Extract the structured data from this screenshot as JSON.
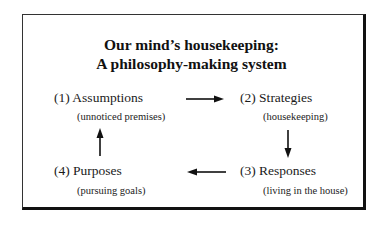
{
  "title": {
    "line1": "Our mind’s housekeeping:",
    "line2": "A  philosophy-making system"
  },
  "nodes": [
    {
      "label": "(1) Assumptions",
      "sub": "(unnoticed premises)"
    },
    {
      "label": "(2) Strategies",
      "sub": "(housekeeping)"
    },
    {
      "label": "(3) Responses",
      "sub": "(living in the house)"
    },
    {
      "label": "(4) Purposes",
      "sub": "(pursuing goals)"
    }
  ],
  "arrows": [
    {
      "from": "(1) Assumptions",
      "to": "(2) Strategies",
      "direction": "right"
    },
    {
      "from": "(2) Strategies",
      "to": "(3) Responses",
      "direction": "down"
    },
    {
      "from": "(3) Responses",
      "to": "(4) Purposes",
      "direction": "left"
    },
    {
      "from": "(4) Purposes",
      "to": "(1) Assumptions",
      "direction": "up"
    }
  ]
}
